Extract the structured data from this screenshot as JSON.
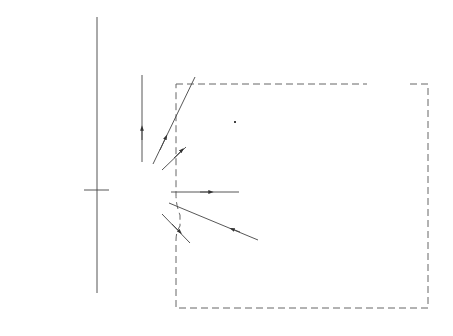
{
  "diagram": {
    "type": "capital flow diagram",
    "nodes": [
      {
        "id": 1,
        "number": "1",
        "lines": [
          "Share and",
          "loan",
          "capital"
        ]
      },
      {
        "id": 2,
        "number": "2",
        "lines": [
          "Cash"
        ]
      },
      {
        "id": 3,
        "number": "3",
        "lines": [
          "Fixed",
          "assets"
        ]
      },
      {
        "id": 4,
        "number": "4",
        "lines": [
          "Outside",
          "invest-",
          "ments"
        ]
      },
      {
        "id": 5,
        "number": "5",
        "lines": [
          "Material",
          "or merch-",
          "andise"
        ]
      },
      {
        "id": 6,
        "number": "6",
        "lines": [
          "Labour"
        ]
      },
      {
        "id": 7,
        "number": "7",
        "lines": [
          "Overheads"
        ]
      },
      {
        "id": 8,
        "number": "8",
        "lines": [
          "Finished goods,",
          "services or",
          "saleable",
          "merchandise"
        ]
      },
      {
        "id": 9,
        "number": "9",
        "lines": [
          "Debtors"
        ]
      },
      {
        "id": 10,
        "number": "10",
        "lines": [
          "Creditors"
        ]
      }
    ],
    "sales_box": {
      "label": "Sales"
    },
    "working_capital": {
      "line1": "Working",
      "line2": "capital"
    },
    "edges": [
      {
        "from": 1,
        "to": 2
      },
      {
        "from": 2,
        "to": 3
      },
      {
        "from": 2,
        "to": 4
      },
      {
        "from": 2,
        "to": 5
      },
      {
        "from": 2,
        "to": 10
      },
      {
        "from": 2,
        "to": 9
      },
      {
        "from": 5,
        "to": 6
      },
      {
        "from": 10,
        "to": 5
      },
      {
        "from": 10,
        "to": 6
      },
      {
        "from": 6,
        "to": 7
      },
      {
        "from": 10,
        "to": 7
      },
      {
        "from": 7,
        "to": 8
      },
      {
        "from": 8,
        "to": "Sales"
      },
      {
        "from": "Sales",
        "to": 9
      },
      {
        "from": "Sales",
        "to": 2
      }
    ],
    "captions": {
      "left_line1": "From where capital",
      "left_line2": "has been obtained",
      "right": "In what areas capital has been invested"
    }
  }
}
